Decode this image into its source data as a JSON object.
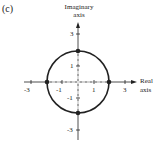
{
  "figure": {
    "panel_label": "(c)",
    "y_axis_label_line1": "Imaginary",
    "y_axis_label_line2": "axis",
    "x_axis_label_line1": "Real",
    "x_axis_label_line2": "axis",
    "x_ticks": [
      "-3",
      "-1",
      "1",
      "3"
    ],
    "y_ticks": [
      "3",
      "1",
      "-1",
      "-3"
    ],
    "circle": {
      "center": [
        0,
        0
      ],
      "radius": 2
    },
    "points": [
      [
        2,
        0
      ],
      [
        -2,
        0
      ],
      [
        0,
        2
      ],
      [
        0,
        -2
      ]
    ],
    "colors": {
      "ink": "#222222"
    }
  }
}
